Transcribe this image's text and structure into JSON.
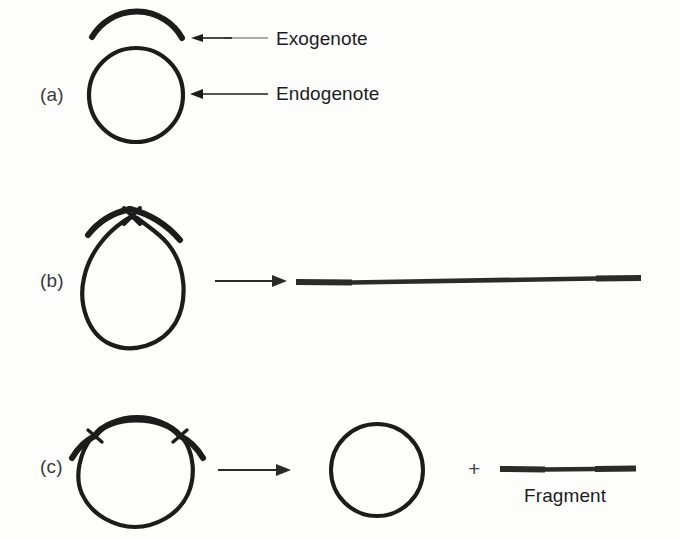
{
  "figure": {
    "width": 679,
    "height": 538,
    "background_color": "#fdfdfc",
    "ink_color": "#1c1c1c",
    "arrow_color": "#2a2a2a"
  },
  "panels": [
    {
      "id": "a",
      "label": "(a)",
      "caption": "Merozygote: exogenote paired above circular endogenote",
      "callouts": [
        {
          "name": "exogenote",
          "label": "Exogenote",
          "arrow_direction": "left",
          "arrow_style": "thin-faded"
        },
        {
          "name": "endogenote",
          "label": "Endogenote",
          "arrow_direction": "left",
          "arrow_style": "thin-solid"
        }
      ]
    },
    {
      "id": "b",
      "label": "(b)",
      "caption": "Single crossover yields a linear molecule",
      "crossovers": 1,
      "product_label": "",
      "transform_arrow": "right"
    },
    {
      "id": "c",
      "label": "(c)",
      "caption": "Double crossover yields a circular recombinant plus a fragment",
      "crossovers": 2,
      "plus_symbol": "+",
      "product_label": "Fragment",
      "transform_arrow": "right"
    }
  ]
}
